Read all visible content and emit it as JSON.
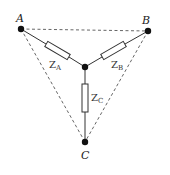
{
  "diagram": {
    "type": "star (Y) connection of impedances with delta outline",
    "nodes": {
      "A": {
        "label": "A",
        "x": 21,
        "y": 29
      },
      "B": {
        "label": "B",
        "x": 148,
        "y": 31
      },
      "C": {
        "label": "C",
        "x": 85,
        "y": 142
      },
      "N": {
        "label": "",
        "x": 85,
        "y": 67
      }
    },
    "impedances": [
      {
        "id": "ZA",
        "symbol": "Z",
        "subscript": "A",
        "from": "A",
        "to": "N"
      },
      {
        "id": "ZB",
        "symbol": "Z",
        "subscript": "B",
        "from": "B",
        "to": "N"
      },
      {
        "id": "ZC",
        "symbol": "Z",
        "subscript": "C",
        "from": "N",
        "to": "C"
      }
    ],
    "dashed_edges": [
      [
        "A",
        "B"
      ],
      [
        "A",
        "C"
      ],
      [
        "B",
        "C"
      ]
    ],
    "colors": {
      "line": "#333333",
      "dashed": "#555555",
      "node": "#111111"
    }
  }
}
